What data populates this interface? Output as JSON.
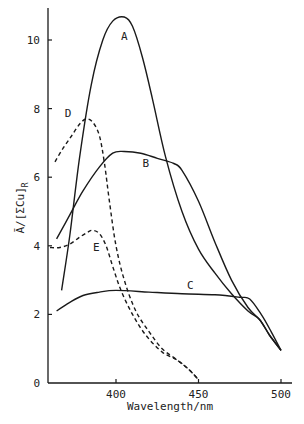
{
  "chart_data": {
    "type": "line",
    "title": "",
    "xlabel": "Wavelength/nm",
    "ylabel": "Ā/[ΣCu]",
    "ylabel_subscript": "R",
    "xlim": [
      358.5,
      506
    ],
    "ylim": [
      0,
      10.9
    ],
    "x_ticks": [
      400,
      450,
      500
    ],
    "y_ticks": [
      0,
      2,
      4,
      6,
      8,
      10
    ],
    "grid": false,
    "legend": "inline labels",
    "series": [
      {
        "name": "A",
        "style": "solid",
        "label_pos": [
          405,
          10.0
        ],
        "points": [
          [
            367,
            2.7
          ],
          [
            372,
            4.3
          ],
          [
            378,
            6.6
          ],
          [
            385,
            8.7
          ],
          [
            392,
            10.0
          ],
          [
            398,
            10.55
          ],
          [
            405,
            10.67
          ],
          [
            410,
            10.4
          ],
          [
            416,
            9.5
          ],
          [
            422,
            8.3
          ],
          [
            430,
            6.6
          ],
          [
            440,
            5.0
          ],
          [
            450,
            3.9
          ],
          [
            460,
            3.2
          ],
          [
            470,
            2.6
          ],
          [
            480,
            2.1
          ],
          [
            487,
            1.85
          ],
          [
            493,
            1.4
          ],
          [
            500,
            0.95
          ]
        ]
      },
      {
        "name": "B",
        "style": "solid",
        "label_pos": [
          418,
          6.3
        ],
        "points": [
          [
            364,
            4.2
          ],
          [
            372,
            4.9
          ],
          [
            380,
            5.6
          ],
          [
            390,
            6.3
          ],
          [
            398,
            6.7
          ],
          [
            405,
            6.75
          ],
          [
            415,
            6.7
          ],
          [
            425,
            6.55
          ],
          [
            435,
            6.4
          ],
          [
            440,
            6.2
          ],
          [
            450,
            5.3
          ],
          [
            460,
            4.1
          ],
          [
            470,
            3.0
          ],
          [
            480,
            2.2
          ],
          [
            487,
            1.85
          ],
          [
            493,
            1.4
          ],
          [
            500,
            0.95
          ]
        ]
      },
      {
        "name": "C",
        "style": "solid",
        "label_pos": [
          445,
          2.75
        ],
        "points": [
          [
            364,
            2.1
          ],
          [
            372,
            2.35
          ],
          [
            380,
            2.55
          ],
          [
            390,
            2.65
          ],
          [
            400,
            2.7
          ],
          [
            420,
            2.65
          ],
          [
            440,
            2.6
          ],
          [
            460,
            2.57
          ],
          [
            475,
            2.5
          ],
          [
            481,
            2.45
          ],
          [
            488,
            2.0
          ],
          [
            494,
            1.5
          ],
          [
            500,
            0.95
          ]
        ]
      },
      {
        "name": "D",
        "style": "dashed",
        "label_pos": [
          371,
          7.75
        ],
        "points": [
          [
            363,
            6.45
          ],
          [
            368,
            6.85
          ],
          [
            373,
            7.2
          ],
          [
            378,
            7.55
          ],
          [
            382,
            7.7
          ],
          [
            386,
            7.6
          ],
          [
            390,
            7.2
          ],
          [
            393,
            6.4
          ],
          [
            396,
            5.3
          ],
          [
            400,
            4.0
          ],
          [
            405,
            3.0
          ],
          [
            412,
            2.1
          ],
          [
            420,
            1.5
          ],
          [
            428,
            1.0
          ],
          [
            437,
            0.67
          ],
          [
            444,
            0.4
          ],
          [
            450,
            0.1
          ]
        ]
      },
      {
        "name": "E",
        "style": "dashed",
        "label_pos": [
          388,
          3.85
        ],
        "points": [
          [
            360,
            3.95
          ],
          [
            366,
            3.95
          ],
          [
            372,
            4.05
          ],
          [
            378,
            4.25
          ],
          [
            383,
            4.4
          ],
          [
            386,
            4.45
          ],
          [
            390,
            4.35
          ],
          [
            394,
            4.0
          ],
          [
            398,
            3.4
          ],
          [
            403,
            2.7
          ],
          [
            410,
            2.0
          ],
          [
            418,
            1.4
          ],
          [
            428,
            0.9
          ],
          [
            437,
            0.67
          ],
          [
            444,
            0.4
          ],
          [
            450,
            0.1
          ]
        ]
      }
    ]
  },
  "axes": {
    "x_tick_labels": [
      "400",
      "450",
      "500"
    ],
    "y_tick_labels": [
      "0",
      "2",
      "4",
      "6",
      "8",
      "10"
    ],
    "xlabel": "Wavelength/nm",
    "ylabel": "Ā/[ΣCu]",
    "ylabel_sub": "R"
  },
  "colors": {
    "ink": "#1a1a1a",
    "background": "#ffffff"
  }
}
